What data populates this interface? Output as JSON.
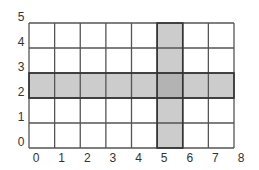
{
  "diagram": {
    "type": "grid",
    "columns": 8,
    "rows": 5,
    "x_labels": [
      "0",
      "1",
      "2",
      "3",
      "4",
      "5",
      "6",
      "7",
      "8"
    ],
    "y_labels": [
      "0",
      "1",
      "2",
      "3",
      "4",
      "5"
    ],
    "highlighted_row": 2,
    "highlighted_column": 5,
    "colors": {
      "background": "#ffffff",
      "grid_line": "#555555",
      "shade": "#cccccc",
      "intersection": "#b3b3b3",
      "label": "#333333"
    }
  }
}
